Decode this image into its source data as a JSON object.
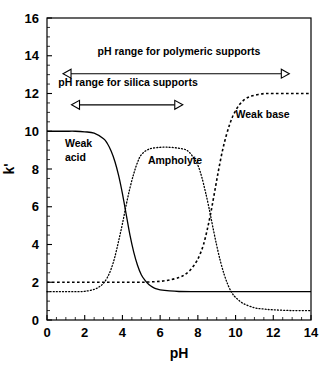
{
  "chart_data": {
    "type": "line",
    "title": "",
    "xlabel": "pH",
    "ylabel": "k'",
    "xlim": [
      0,
      14
    ],
    "ylim": [
      0,
      16
    ],
    "xticks": [
      0,
      2,
      4,
      6,
      8,
      10,
      12,
      14
    ],
    "xtick_labels": [
      "0",
      "2",
      "4",
      "6",
      "8",
      "10",
      "12",
      "14"
    ],
    "yticks": [
      0,
      2,
      4,
      6,
      8,
      10,
      12,
      14,
      16
    ],
    "ytick_labels": [
      "0",
      "2",
      "4",
      "6",
      "8",
      "10",
      "12",
      "14",
      "16"
    ],
    "xminor_step": 0.5,
    "yminor_step": 0.5,
    "grid": false,
    "legend": "inline-labels",
    "series": [
      {
        "name": "Weak acid",
        "style": "solid",
        "label": "Weak acid",
        "label_line1": "Weak",
        "label_line2": "acid",
        "label_x": 0.95,
        "label_y": 9.15,
        "description": "Descending sigmoid, plateau 10 below pH 3, inflection pH 4.3, plateau 1.5 above pH 6",
        "x": [
          0,
          0.5,
          1,
          1.5,
          2,
          2.5,
          3,
          3.2,
          3.4,
          3.6,
          3.8,
          4,
          4.2,
          4.4,
          4.6,
          4.8,
          5,
          5.2,
          5.4,
          5.6,
          5.8,
          6,
          6.5,
          7,
          8,
          9,
          10,
          11,
          12,
          13,
          14
        ],
        "y": [
          10,
          10,
          10,
          10,
          9.97,
          9.9,
          9.6,
          9.35,
          8.95,
          8.4,
          7.65,
          6.7,
          5.6,
          4.5,
          3.6,
          2.9,
          2.4,
          2.1,
          1.88,
          1.74,
          1.65,
          1.6,
          1.54,
          1.51,
          1.5,
          1.5,
          1.5,
          1.5,
          1.5,
          1.5,
          1.5
        ]
      },
      {
        "name": "Ampholyte",
        "style": "dotted",
        "label": "Ampholyte",
        "label_x": 5.35,
        "label_y": 8.25,
        "description": "Bell curve, tail 1.5 at low pH, plateau 9 between pH 5 and 7.6, sharp drop after pH 8, tail 0.5 at high pH",
        "x": [
          0,
          0.5,
          1,
          1.5,
          2,
          2.5,
          2.8,
          3,
          3.2,
          3.4,
          3.6,
          3.8,
          4,
          4.2,
          4.4,
          4.6,
          4.8,
          5,
          5.4,
          6,
          6.5,
          7,
          7.4,
          7.7,
          8,
          8.2,
          8.4,
          8.6,
          8.8,
          9,
          9.2,
          9.4,
          9.6,
          9.8,
          10,
          10.4,
          11,
          11.5,
          12,
          13,
          14
        ],
        "y": [
          1.5,
          1.5,
          1.5,
          1.5,
          1.52,
          1.62,
          1.78,
          1.95,
          2.25,
          2.7,
          3.35,
          4.2,
          5.1,
          6.1,
          7.0,
          7.75,
          8.35,
          8.75,
          9.05,
          9.15,
          9.15,
          9.1,
          9.0,
          8.7,
          8.2,
          7.6,
          6.8,
          5.9,
          4.9,
          3.95,
          3.1,
          2.4,
          1.85,
          1.45,
          1.2,
          0.88,
          0.65,
          0.58,
          0.54,
          0.5,
          0.5
        ]
      },
      {
        "name": "Weak base",
        "style": "dashed",
        "label": "Weak base",
        "label_x": 10.0,
        "label_y": 10.7,
        "description": "Ascending sigmoid, plateau 2 below pH 7, inflection pH 8.9, plateau 12 above pH 11",
        "x": [
          0,
          1,
          2,
          3,
          4,
          5,
          5.5,
          6,
          6.5,
          7,
          7.3,
          7.6,
          7.9,
          8.1,
          8.3,
          8.5,
          8.7,
          8.9,
          9.1,
          9.3,
          9.5,
          9.7,
          9.9,
          10.2,
          10.5,
          10.8,
          11.2,
          11.6,
          12,
          12.5,
          13,
          13.5,
          14
        ],
        "y": [
          2.0,
          2.0,
          2.0,
          2.0,
          2.0,
          2.0,
          2.02,
          2.05,
          2.12,
          2.25,
          2.4,
          2.65,
          3.05,
          3.45,
          4.0,
          4.8,
          5.75,
          6.85,
          7.95,
          8.95,
          9.75,
          10.4,
          10.9,
          11.4,
          11.7,
          11.85,
          11.95,
          12.0,
          12.0,
          12.0,
          12.0,
          12.0,
          12.0
        ]
      }
    ],
    "annotations": [
      {
        "id": "polymeric-range",
        "text": "pH range for polymeric supports",
        "text_x": 7.0,
        "text_y": 14.05,
        "arrow_y": 13.05,
        "arrow_x_start": 0.85,
        "arrow_x_end": 12.85,
        "arrow_style": "double-headed-open"
      },
      {
        "id": "silica-range",
        "text": "pH range for silica supports",
        "text_x": 4.3,
        "text_y": 12.4,
        "arrow_y": 11.4,
        "arrow_x_start": 1.3,
        "arrow_x_end": 7.2,
        "arrow_style": "double-headed-open"
      }
    ]
  },
  "colors": {
    "axis": "#000000",
    "curve": "#000000",
    "background": "#ffffff"
  }
}
